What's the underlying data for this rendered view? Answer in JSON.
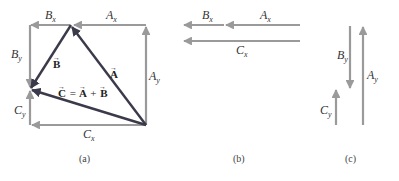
{
  "colors": {
    "component": "#9a9a9a",
    "vector": "#3a3a4a",
    "text": "#333333"
  },
  "panels": [
    {
      "caption": "(a)",
      "vectors": [
        {
          "label": "A",
          "type": "vector"
        },
        {
          "label": "B",
          "type": "vector"
        },
        {
          "label": "C = A + B",
          "type": "vector"
        }
      ],
      "components": [
        "A",
        "x",
        "A",
        "y",
        "B",
        "x",
        "B",
        "y",
        "C",
        "x",
        "C",
        "y"
      ]
    },
    {
      "caption": "(b)",
      "components": [
        "A",
        "x",
        "B",
        "x",
        "C",
        "x"
      ]
    },
    {
      "caption": "(c)",
      "components": [
        "B",
        "y",
        "A",
        "y",
        "C",
        "y"
      ]
    }
  ],
  "labels": {
    "a": {
      "Bx": {
        "main": "B",
        "sub": "x"
      },
      "Ax": {
        "main": "A",
        "sub": "x"
      },
      "By": {
        "main": "B",
        "sub": "y"
      },
      "Ay": {
        "main": "A",
        "sub": "y"
      },
      "Cy": {
        "main": "C",
        "sub": "y"
      },
      "Cx": {
        "main": "C",
        "sub": "x"
      },
      "vecA": "A",
      "vecB": "B",
      "vecC_eq": "C = A + B",
      "vecC": "C",
      "eq": "=",
      "plus": "+",
      "arrow": "→"
    },
    "b": {
      "Bx": {
        "main": "B",
        "sub": "x"
      },
      "Ax": {
        "main": "A",
        "sub": "x"
      },
      "Cx": {
        "main": "C",
        "sub": "x"
      }
    },
    "c": {
      "By": {
        "main": "B",
        "sub": "y"
      },
      "Ay": {
        "main": "A",
        "sub": "y"
      },
      "Cy": {
        "main": "C",
        "sub": "y"
      }
    }
  },
  "captions": {
    "a": "(a)",
    "b": "(b)",
    "c": "(c)"
  }
}
